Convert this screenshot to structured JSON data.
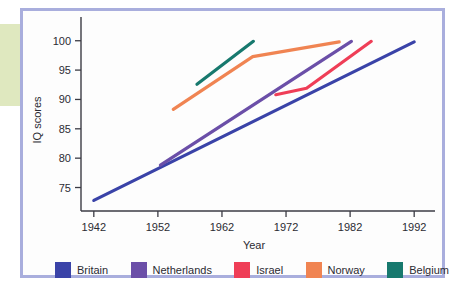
{
  "figure": {
    "border_color": "#a9aedd",
    "background": "#fdfdfd",
    "accent_band_color": "#dfe8bf"
  },
  "chart_data": {
    "type": "line",
    "title": "",
    "xlabel": "Year",
    "ylabel": "IQ scores",
    "xlim": [
      1940,
      1994
    ],
    "ylim": [
      71,
      102
    ],
    "xticks": [
      1942,
      1952,
      1962,
      1972,
      1982,
      1992
    ],
    "xtick_labels": [
      "1942",
      "1952",
      "1962",
      "1972",
      "1982",
      "1992"
    ],
    "yticks": [
      75,
      80,
      85,
      90,
      95,
      100
    ],
    "ytick_labels": [
      "75",
      "80",
      "85",
      "90",
      "95",
      "100"
    ],
    "grid": false,
    "legend_position": "bottom",
    "series": [
      {
        "name": "Britain",
        "color": "#3a43a8",
        "x": [
          1942,
          1992
        ],
        "y": [
          72.8,
          99.8
        ]
      },
      {
        "name": "Netherlands",
        "color": "#6b4fa8",
        "x": [
          1952.4,
          1982.2
        ],
        "y": [
          78.8,
          99.9
        ]
      },
      {
        "name": "Israel",
        "color": "#ef3e57",
        "x": [
          1970.4,
          1975.2,
          1985.3
        ],
        "y": [
          90.8,
          91.9,
          99.9
        ]
      },
      {
        "name": "Norway",
        "color": "#f08452",
        "x": [
          1954.4,
          1966.8,
          1980.3
        ],
        "y": [
          88.3,
          97.3,
          99.8
        ]
      },
      {
        "name": "Belgium",
        "color": "#17796e",
        "x": [
          1958.1,
          1966.9
        ],
        "y": [
          92.6,
          99.9
        ]
      }
    ]
  },
  "legend": {
    "items": [
      {
        "label": "Britain",
        "color": "#3a43a8"
      },
      {
        "label": "Netherlands",
        "color": "#6b4fa8"
      },
      {
        "label": "Israel",
        "color": "#ef3e57"
      },
      {
        "label": "Norway",
        "color": "#f08452"
      },
      {
        "label": "Belgium",
        "color": "#17796e"
      }
    ]
  }
}
